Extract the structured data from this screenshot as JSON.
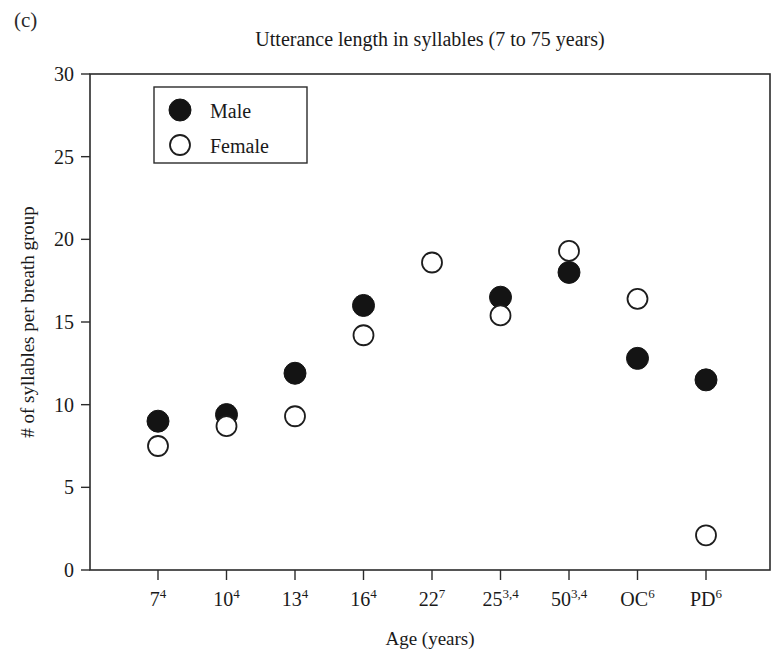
{
  "figure": {
    "panel_label": "(c)",
    "title": "Utterance length in syllables (7 to 75 years)"
  },
  "legend": {
    "position": "top-left-inside",
    "entries": [
      {
        "label": "Male",
        "marker": "filled-circle",
        "color": "#141414"
      },
      {
        "label": "Female",
        "marker": "open-circle",
        "color": "#ffffff"
      }
    ]
  },
  "axes": {
    "x": {
      "label": "Age (years)",
      "tick_labels": [
        "7",
        "10",
        "13",
        "16",
        "22",
        "25",
        "50",
        "OC",
        "PD"
      ],
      "tick_superscripts": [
        "4",
        "4",
        "4",
        "4",
        "7",
        "3,4",
        "3,4",
        "6",
        "6"
      ]
    },
    "y": {
      "label": "# of syllables per breath group",
      "ticks": [
        0,
        5,
        10,
        15,
        20,
        25,
        30
      ],
      "min": 0,
      "max": 30
    }
  },
  "chart_data": {
    "type": "scatter",
    "title": "Utterance length in syllables (7 to 75 years)",
    "xlabel": "Age (years)",
    "ylabel": "# of syllables per breath group",
    "categories": [
      "7",
      "10",
      "13",
      "16",
      "22",
      "25",
      "50",
      "OC",
      "PD"
    ],
    "category_superscripts": [
      "4",
      "4",
      "4",
      "4",
      "7",
      "3,4",
      "3,4",
      "6",
      "6"
    ],
    "ylim": [
      0,
      30
    ],
    "yticks": [
      0,
      5,
      10,
      15,
      20,
      25,
      30
    ],
    "grid": false,
    "legend_position": "upper left",
    "series": [
      {
        "name": "Male",
        "marker": "filled-circle",
        "color": "#141414",
        "values": [
          9.0,
          9.4,
          11.9,
          16.0,
          null,
          16.5,
          18.0,
          12.8,
          11.5
        ]
      },
      {
        "name": "Female",
        "marker": "open-circle",
        "color": "#ffffff",
        "values": [
          7.5,
          8.7,
          9.3,
          14.2,
          18.6,
          15.4,
          19.3,
          16.4,
          2.1
        ]
      }
    ]
  },
  "colors": {
    "axis": "#2b2b2b",
    "text": "#1a1a1a",
    "male": "#141414",
    "female_fill": "#ffffff",
    "background": "#ffffff"
  }
}
